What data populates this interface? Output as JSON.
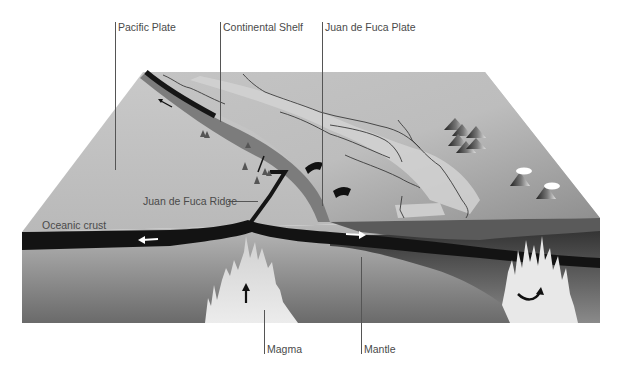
{
  "labels": {
    "pacific_plate": "Pacific Plate",
    "continental_shelf": "Continental Shelf",
    "juan_de_fuca_plate": "Juan de Fuca Plate",
    "juan_de_fuca_ridge": "Juan de Fuca Ridge",
    "oceanic_crust": "Oceanic crust",
    "magma": "Magma",
    "mantle": "Mantle"
  },
  "colors": {
    "surface_light": "#d9d9d9",
    "surface_mid": "#a8a8a8",
    "crust": "#141414",
    "mantle_top": "#c8c8c8",
    "mantle_bottom": "#6e6e6e",
    "magma": "#e6e6e6",
    "label_text": "#4a4a4a"
  }
}
